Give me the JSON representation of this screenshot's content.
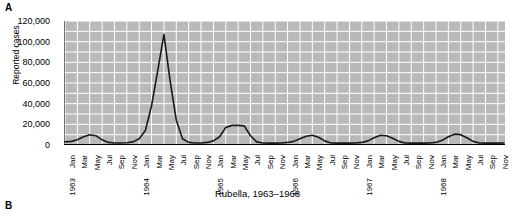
{
  "panels": {
    "a_letter": "A",
    "b_letter": "B"
  },
  "caption": "Rubella, 1963–1968",
  "chart_data": {
    "type": "line",
    "title": "Rubella, 1963–1968",
    "xlabel": "",
    "ylabel": "Reported cases",
    "ylim": [
      0,
      120000
    ],
    "ytick_values": [
      0,
      20000,
      40000,
      60000,
      80000,
      100000,
      120000
    ],
    "ytick_labels": [
      "0",
      "20,000",
      "40,000",
      "60,000",
      "80,000",
      "100,000",
      "120,000"
    ],
    "y_minor_step": 10000,
    "grid": true,
    "grid_color": "#ffffff",
    "plot_bg": "#b9b9b9",
    "line_color": "#1a1a1a",
    "legend": "none",
    "x_start": "Jan 1963",
    "x_end": "Dec 1968",
    "x_tick_step_months": 2,
    "x": [
      "Jan 1963",
      "Feb 1963",
      "Mar 1963",
      "Apr 1963",
      "May 1963",
      "Jun 1963",
      "Jul 1963",
      "Aug 1963",
      "Sep 1963",
      "Oct 1963",
      "Nov 1963",
      "Dec 1963",
      "Jan 1964",
      "Feb 1964",
      "Mar 1964",
      "Apr 1964",
      "May 1964",
      "Jun 1964",
      "Jul 1964",
      "Aug 1964",
      "Sep 1964",
      "Oct 1964",
      "Nov 1964",
      "Dec 1964",
      "Jan 1965",
      "Feb 1965",
      "Mar 1965",
      "Apr 1965",
      "May 1965",
      "Jun 1965",
      "Jul 1965",
      "Aug 1965",
      "Sep 1965",
      "Oct 1965",
      "Nov 1965",
      "Dec 1965",
      "Jan 1966",
      "Feb 1966",
      "Mar 1966",
      "Apr 1966",
      "May 1966",
      "Jun 1966",
      "Jul 1966",
      "Aug 1966",
      "Sep 1966",
      "Oct 1966",
      "Nov 1966",
      "Dec 1966",
      "Jan 1967",
      "Feb 1967",
      "Mar 1967",
      "Apr 1967",
      "May 1967",
      "Jun 1967",
      "Jul 1967",
      "Aug 1967",
      "Sep 1967",
      "Oct 1967",
      "Nov 1967",
      "Dec 1967",
      "Jan 1968",
      "Feb 1968",
      "Mar 1968",
      "Apr 1968",
      "May 1968",
      "Jun 1968",
      "Jul 1968",
      "Aug 1968",
      "Sep 1968",
      "Oct 1968",
      "Nov 1968",
      "Dec 1968"
    ],
    "xtick_labels": [
      "Jan 1963",
      "Mar",
      "May",
      "Jul",
      "Sep",
      "Nov",
      "Jan 1964",
      "Mar",
      "May",
      "Jul",
      "Sep",
      "Nov",
      "Jan 1965",
      "Mar",
      "May",
      "Jul",
      "Sep",
      "Nov",
      "Jan 1966",
      "Mar",
      "May",
      "Jul",
      "Sep",
      "Nov",
      "Jan 1967",
      "Mar",
      "May",
      "Jul",
      "Sep",
      "Nov",
      "Jan 1968",
      "Mar",
      "May",
      "Jul",
      "Sep",
      "Nov"
    ],
    "values": [
      3000,
      3500,
      5000,
      8000,
      10000,
      9000,
      5000,
      2500,
      2000,
      2000,
      2200,
      3000,
      6000,
      14000,
      38000,
      72000,
      107000,
      62000,
      24000,
      6000,
      2500,
      2000,
      2000,
      2500,
      4000,
      8000,
      17000,
      19000,
      19000,
      18500,
      9000,
      3000,
      2000,
      1800,
      1800,
      2000,
      2500,
      3500,
      6000,
      8500,
      9500,
      7500,
      4000,
      2000,
      1800,
      1800,
      1800,
      2000,
      2500,
      4000,
      7000,
      9500,
      9000,
      6500,
      3500,
      2000,
      1800,
      1800,
      1800,
      2000,
      2500,
      4500,
      8000,
      10500,
      10000,
      7000,
      3500,
      2000,
      1800,
      1800,
      1800,
      2000
    ]
  }
}
